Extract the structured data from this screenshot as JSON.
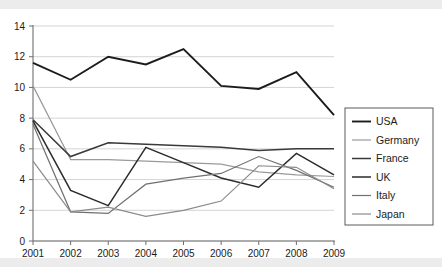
{
  "chart_data": {
    "type": "line",
    "title": "",
    "subtitle": "",
    "xlabel": "",
    "ylabel": "",
    "categories": [
      "2001",
      "2002",
      "2003",
      "2004",
      "2005",
      "2006",
      "2007",
      "2008",
      "2009"
    ],
    "x": [
      2001,
      2002,
      2003,
      2004,
      2005,
      2006,
      2007,
      2008,
      2009
    ],
    "xlim": [
      2001,
      2009
    ],
    "ylim": [
      0,
      14
    ],
    "yticks": [
      0,
      2,
      4,
      6,
      8,
      10,
      12,
      14
    ],
    "ytick_labels": [
      "0",
      "2",
      "4",
      "6",
      "8",
      "10",
      "12",
      "14"
    ],
    "grid": true,
    "legend_position": "right",
    "series": [
      {
        "name": "USA",
        "color": "#1c1c1c",
        "width": 1.9,
        "values": [
          11.6,
          10.5,
          12.0,
          11.5,
          12.5,
          10.1,
          9.9,
          11.0,
          8.2
        ]
      },
      {
        "name": "Germany",
        "color": "#9a9a9a",
        "width": 1.2,
        "values": [
          10.1,
          5.3,
          5.3,
          5.2,
          5.1,
          5.0,
          4.5,
          4.3,
          4.2
        ]
      },
      {
        "name": "France",
        "color": "#3a3a3a",
        "width": 1.5,
        "values": [
          7.9,
          5.5,
          6.4,
          6.3,
          6.2,
          6.1,
          5.9,
          6.0,
          6.0
        ]
      },
      {
        "name": "UK",
        "color": "#2b2b2b",
        "width": 1.5,
        "values": [
          7.8,
          3.3,
          2.3,
          6.1,
          5.1,
          4.1,
          3.5,
          5.7,
          4.3
        ]
      },
      {
        "name": "Italy",
        "color": "#707070",
        "width": 1.2,
        "values": [
          7.6,
          1.9,
          1.8,
          3.7,
          4.1,
          4.4,
          5.5,
          4.6,
          3.5
        ]
      },
      {
        "name": "Japan",
        "color": "#8b8b8b",
        "width": 1.2,
        "values": [
          5.2,
          1.9,
          2.2,
          1.6,
          2.0,
          2.6,
          4.9,
          4.8,
          3.4
        ]
      }
    ]
  },
  "legend": {
    "items": [
      {
        "label": "USA"
      },
      {
        "label": "Germany"
      },
      {
        "label": "France"
      },
      {
        "label": "UK"
      },
      {
        "label": "Italy"
      },
      {
        "label": "Japan"
      }
    ]
  },
  "colors": {
    "background": "#ffffff",
    "band": "#ececed",
    "grid": "#c9c9c9",
    "axis": "#6f6f6f",
    "text": "#1b1b1b"
  }
}
